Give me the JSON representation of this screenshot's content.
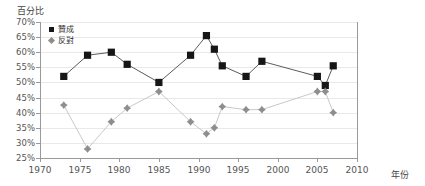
{
  "chart_data": {
    "type": "line",
    "title": "",
    "ylabel": "百分比",
    "xlabel": "年份",
    "xlim": [
      1970,
      2010
    ],
    "ylim": [
      25,
      70
    ],
    "ytick_step": 5,
    "xtick_step": 5,
    "grid": true,
    "legend_position": "top-left",
    "yticks": [
      "70%",
      "65%",
      "60%",
      "55%",
      "50%",
      "45%",
      "40%",
      "35%",
      "30%",
      "25%"
    ],
    "ytick_values": [
      70,
      65,
      60,
      55,
      50,
      45,
      40,
      35,
      30,
      25
    ],
    "xticks": [
      "1970",
      "1975",
      "1980",
      "1985",
      "1990",
      "1995",
      "2000",
      "2005",
      "2010"
    ],
    "xtick_values": [
      1970,
      1975,
      1980,
      1985,
      1990,
      1995,
      2000,
      2005,
      2010
    ],
    "series": [
      {
        "name": "贊成",
        "marker": "square",
        "color": "#161616",
        "x": [
          1973,
          1976,
          1979,
          1981,
          1985,
          1989,
          1991,
          1992,
          1993,
          1996,
          1998,
          2005,
          2006,
          2007
        ],
        "values": [
          52,
          59,
          60,
          56,
          50,
          59,
          65.5,
          61,
          55.5,
          52,
          57,
          52,
          49,
          55.5
        ]
      },
      {
        "name": "反對",
        "marker": "diamond",
        "color": "#8e8e8e",
        "x": [
          1973,
          1976,
          1979,
          1981,
          1985,
          1989,
          1991,
          1992,
          1993,
          1996,
          1998,
          2005,
          2006,
          2007
        ],
        "values": [
          42.5,
          28,
          37,
          41.5,
          47,
          37,
          33,
          35,
          42,
          41,
          41,
          47,
          47,
          40
        ]
      }
    ]
  },
  "legend": {
    "items": [
      {
        "label": "贊成"
      },
      {
        "label": "反對"
      }
    ]
  },
  "colors": {
    "approve": "#161616",
    "oppose": "#8e8e8e",
    "axis": "#9a9a9a",
    "grid": "#e9e9e9",
    "text": "#555555"
  }
}
